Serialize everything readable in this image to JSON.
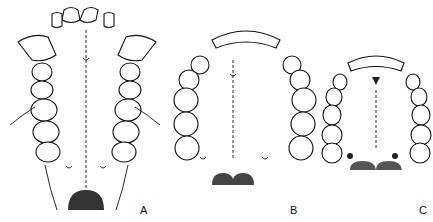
{
  "figure": {
    "panels": [
      {
        "label": "A",
        "shape": "U-shaped, parallel tooth rows with large canines"
      },
      {
        "label": "B",
        "shape": "Parabolic arch"
      },
      {
        "label": "C",
        "shape": "Small parabolic arch"
      }
    ]
  }
}
